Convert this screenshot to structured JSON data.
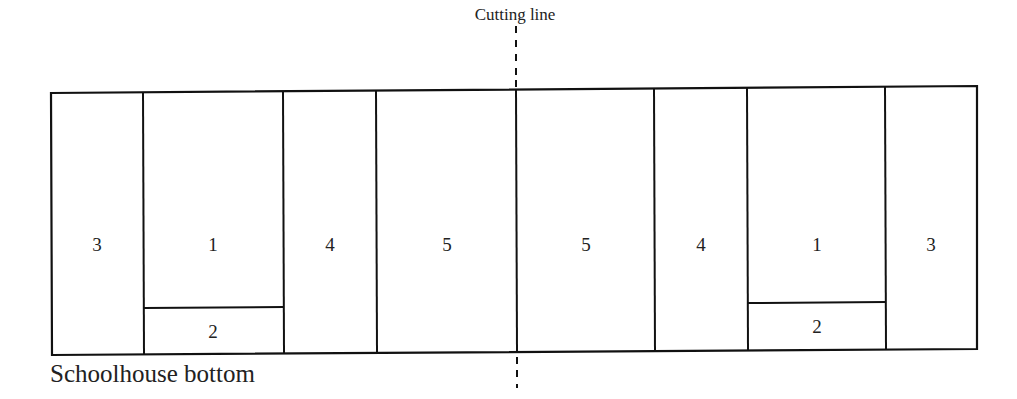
{
  "diagram": {
    "cutting_line_label": "Cutting line",
    "caption": "Schoolhouse bottom",
    "line_color": "#111111",
    "cells": [
      {
        "id": "left-3",
        "label": "3"
      },
      {
        "id": "left-1",
        "label": "1"
      },
      {
        "id": "left-2",
        "label": "2"
      },
      {
        "id": "left-4",
        "label": "4"
      },
      {
        "id": "left-5",
        "label": "5"
      },
      {
        "id": "right-5",
        "label": "5"
      },
      {
        "id": "right-4",
        "label": "4"
      },
      {
        "id": "right-1",
        "label": "1"
      },
      {
        "id": "right-2",
        "label": "2"
      },
      {
        "id": "right-3",
        "label": "3"
      }
    ]
  }
}
